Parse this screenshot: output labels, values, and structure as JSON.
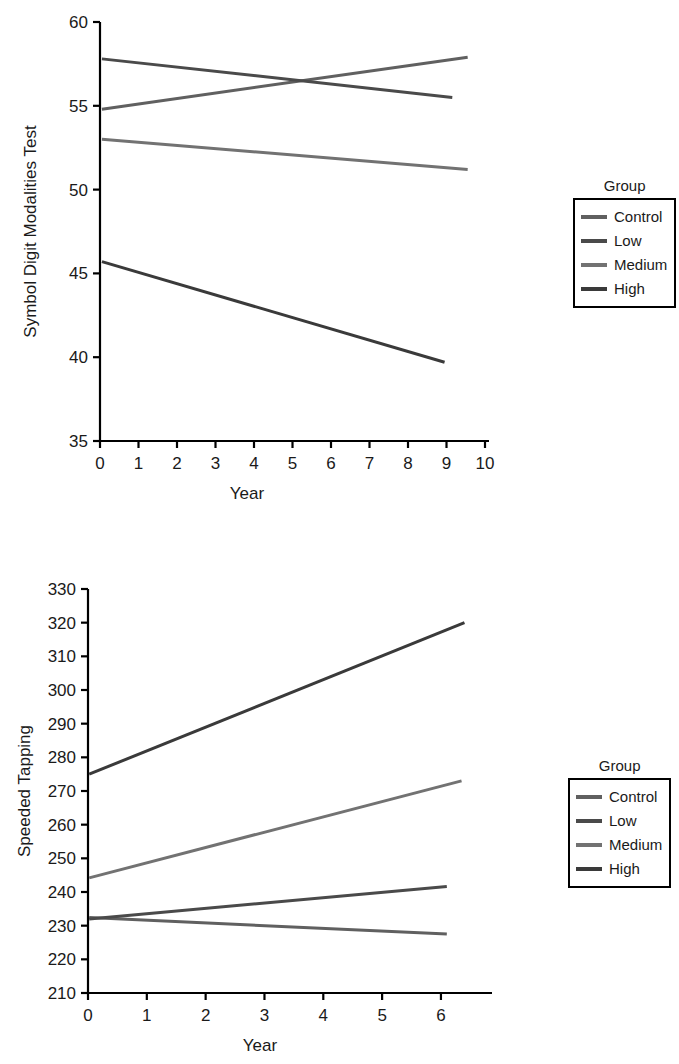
{
  "figure": {
    "background": "#ffffff",
    "axis_color": "#000000",
    "text_color": "#1a1a1a"
  },
  "legend": {
    "title": "Group",
    "entries": [
      {
        "label": "Control",
        "color": "#606060"
      },
      {
        "label": "Low",
        "color": "#4a4a4a"
      },
      {
        "label": "Medium",
        "color": "#727272"
      },
      {
        "label": "High",
        "color": "#3a3a3a"
      }
    ]
  },
  "chart_data": [
    {
      "type": "line",
      "title": "",
      "xlabel": "Year",
      "ylabel": "Symbol Digit Modalities Test",
      "xlim": [
        0,
        10
      ],
      "ylim": [
        35,
        60
      ],
      "xticks": [
        0,
        1,
        2,
        3,
        4,
        5,
        6,
        7,
        8,
        9,
        10
      ],
      "xticklabels": [
        "0",
        "1",
        "2",
        "3",
        "4",
        "5",
        "6",
        "7",
        "8",
        "9",
        "10"
      ],
      "yticks": [
        35,
        40,
        45,
        50,
        55,
        60
      ],
      "yticklabels": [
        "35",
        "40",
        "45",
        "50",
        "55",
        "60"
      ],
      "grid": false,
      "legend_position": "right",
      "series": [
        {
          "name": "Control",
          "color": "#606060",
          "width": 3.0,
          "x": [
            0.05,
            9.55
          ],
          "values": [
            54.8,
            57.9
          ]
        },
        {
          "name": "Low",
          "color": "#4a4a4a",
          "width": 3.0,
          "x": [
            0.05,
            9.15
          ],
          "values": [
            57.8,
            55.5
          ]
        },
        {
          "name": "Medium",
          "color": "#727272",
          "width": 3.0,
          "x": [
            0.05,
            9.55
          ],
          "values": [
            53.0,
            51.2
          ]
        },
        {
          "name": "High",
          "color": "#3a3a3a",
          "width": 3.0,
          "x": [
            0.05,
            8.95
          ],
          "values": [
            45.7,
            39.7
          ]
        }
      ]
    },
    {
      "type": "line",
      "title": "",
      "xlabel": "Year",
      "ylabel": "Speeded Tapping",
      "xlim": [
        0,
        6.8
      ],
      "ylim": [
        210,
        330
      ],
      "xticks": [
        0,
        1,
        2,
        3,
        4,
        5,
        6
      ],
      "xticklabels": [
        "0",
        "1",
        "2",
        "3",
        "4",
        "5",
        "6"
      ],
      "yticks": [
        210,
        220,
        230,
        240,
        250,
        260,
        270,
        280,
        290,
        300,
        310,
        320,
        330
      ],
      "yticklabels": [
        "210",
        "220",
        "230",
        "240",
        "250",
        "260",
        "270",
        "280",
        "290",
        "300",
        "310",
        "320",
        "330"
      ],
      "grid": false,
      "legend_position": "right",
      "series": [
        {
          "name": "Control",
          "color": "#606060",
          "width": 3.0,
          "x": [
            0.02,
            6.1
          ],
          "values": [
            232.4,
            227.5
          ]
        },
        {
          "name": "Low",
          "color": "#4a4a4a",
          "width": 3.0,
          "x": [
            0.02,
            6.1
          ],
          "values": [
            232.0,
            241.6
          ]
        },
        {
          "name": "Medium",
          "color": "#727272",
          "width": 3.0,
          "x": [
            0.02,
            6.35
          ],
          "values": [
            244.2,
            273.0
          ]
        },
        {
          "name": "High",
          "color": "#3a3a3a",
          "width": 3.0,
          "x": [
            0.02,
            6.4
          ],
          "values": [
            275.0,
            320.0
          ]
        }
      ]
    }
  ]
}
